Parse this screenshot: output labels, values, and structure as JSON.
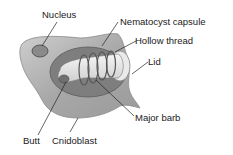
{
  "diagram": {
    "labels": {
      "nucleus": "Nucleus",
      "capsule": "Nematocyst capsule",
      "thread": "Hollow thread",
      "lid": "Lid",
      "barb": "Major barb",
      "butt": "Butt",
      "cnidoblast": "Cnidoblast"
    },
    "colors": {
      "cell_fill": "#a9a9a9",
      "cell_light": "#c8c8c8",
      "capsule_fill": "#7d7d7d",
      "thread_fill": "#e6e6e6",
      "nucleus_fill": "#8a8a8a",
      "line": "#222222"
    }
  }
}
